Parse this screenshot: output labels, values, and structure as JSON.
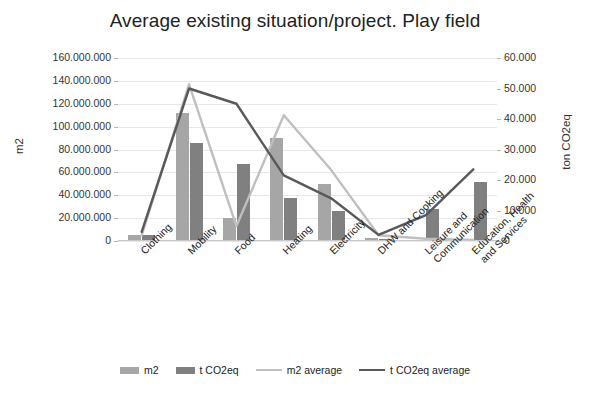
{
  "chart_data": {
    "type": "bar",
    "title": "Average existing situation/project. Play field",
    "xlabel": "",
    "ylabel": "m2",
    "y2label": "ton CO2eq",
    "categories": [
      "Clothing",
      "Mobility",
      "Food",
      "Heating",
      "Electricity",
      "DHW and Cooking",
      "Leisure and Communication",
      "Education, Health and Services"
    ],
    "ylim": [
      0,
      160000000
    ],
    "y2lim": [
      0,
      60000
    ],
    "ytick_labels": [
      "160.000.000",
      "140.000.000",
      "120.000.000",
      "100.000.000",
      "80.000.000",
      "60.000.000",
      "40.000.000",
      "20.000.000",
      "0"
    ],
    "ytick_values": [
      160000000,
      140000000,
      120000000,
      100000000,
      80000000,
      60000000,
      40000000,
      20000000,
      0
    ],
    "y2tick_labels": [
      "60.000",
      "50.000",
      "40.000",
      "30.000",
      "20.000",
      "10.000",
      "0"
    ],
    "y2tick_values": [
      60000,
      50000,
      40000,
      30000,
      20000,
      10000,
      0
    ],
    "grid": true,
    "legend_position": "bottom",
    "series": [
      {
        "name": "m2",
        "kind": "bar",
        "axis": "left",
        "color": "#a6a6a6",
        "values": [
          5000000,
          112000000,
          20000000,
          90000000,
          50000000,
          3000000,
          0,
          0
        ]
      },
      {
        "name": "t CO2eq",
        "kind": "bar",
        "axis": "right",
        "color": "#808080",
        "values": [
          1900,
          32000,
          25200,
          14200,
          9800,
          800,
          10500,
          19500
        ]
      },
      {
        "name": "m2 average",
        "kind": "line",
        "axis": "left",
        "color": "#bfbfbf",
        "values": [
          5000000,
          137000000,
          13000000,
          110000000,
          62000000,
          5000000,
          2000000,
          1000000
        ]
      },
      {
        "name": "t CO2eq average",
        "kind": "line",
        "axis": "right",
        "color": "#595959",
        "values": [
          3000,
          50000,
          45000,
          21500,
          14000,
          2000,
          8500,
          23500
        ]
      }
    ]
  },
  "legend": {
    "items": [
      {
        "label": "m2",
        "marker": "bar",
        "color": "#a6a6a6"
      },
      {
        "label": "t CO2eq",
        "marker": "bar",
        "color": "#808080"
      },
      {
        "label": "m2 average",
        "marker": "line",
        "color": "#bfbfbf"
      },
      {
        "label": "t CO2eq average",
        "marker": "line",
        "color": "#595959"
      }
    ]
  }
}
